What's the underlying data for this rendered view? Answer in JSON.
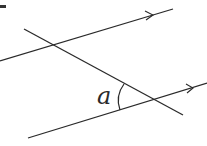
{
  "diagram": {
    "angle_label": "a",
    "line_color": "#2a2a2a",
    "lines": [
      {
        "name": "upper-parallel-line",
        "x1": 0,
        "y1": 61,
        "x2": 173,
        "y2": 9,
        "arrow": true
      },
      {
        "name": "lower-parallel-line",
        "x1": 28,
        "y1": 138,
        "x2": 207,
        "y2": 83,
        "arrow": true
      },
      {
        "name": "transversal-line",
        "x1": 24,
        "y1": 29,
        "x2": 183,
        "y2": 115,
        "arrow": false
      }
    ]
  }
}
